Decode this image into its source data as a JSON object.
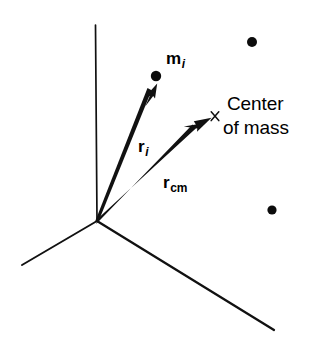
{
  "figure": {
    "background_color": "#ffffff",
    "ink_color": "#000000",
    "width": 317,
    "height": 350
  },
  "labels": {
    "mass_particle": {
      "symbol": "m",
      "subscript": "i",
      "subscript_style": "italic"
    },
    "vector_ri": {
      "symbol": "r",
      "subscript": "i",
      "subscript_style": "italic"
    },
    "vector_rcm": {
      "symbol": "r",
      "subscript": "cm",
      "subscript_style": "roman"
    },
    "center_of_mass_line1": "Center",
    "center_of_mass_line2": "of mass"
  },
  "geometry": {
    "origin": {
      "x": 97,
      "y": 221
    },
    "axes": [
      {
        "name": "vertical-axis",
        "x1": 97,
        "y1": 221,
        "x2": 95,
        "y2": 25,
        "width": 1.6
      },
      {
        "name": "left-axis",
        "x1": 97,
        "y1": 221,
        "x2": 22,
        "y2": 265,
        "width": 1.8
      },
      {
        "name": "right-axis",
        "x1": 97,
        "y1": 221,
        "x2": 274,
        "y2": 330,
        "width": 2.2
      }
    ],
    "vectors": [
      {
        "name": "r-i-arrow",
        "x1": 97,
        "y1": 221,
        "x2": 157,
        "y2": 84
      },
      {
        "name": "r-cm-arrow",
        "x1": 97,
        "y1": 221,
        "x2": 211,
        "y2": 118
      }
    ],
    "point_masses": [
      {
        "name": "mass-i-dot",
        "cx": 156,
        "cy": 76,
        "r": 5.2
      },
      {
        "name": "mass-upper-right-dot",
        "cx": 252,
        "cy": 42,
        "r": 5.0
      },
      {
        "name": "mass-lower-right-dot",
        "cx": 272,
        "cy": 210,
        "r": 4.6
      }
    ],
    "center_marker": {
      "name": "center-of-mass-x-marker",
      "cx": 215,
      "cy": 116,
      "size": 6
    }
  }
}
